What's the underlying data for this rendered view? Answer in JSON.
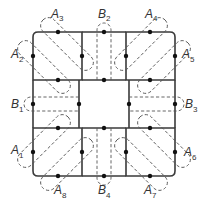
{
  "diagram": {
    "colors": {
      "line": "#3a3a3a",
      "dash": "#555555",
      "point": "#111111",
      "text": "#333333"
    },
    "labels": [
      {
        "id": "A1",
        "letter": "A",
        "index": "1"
      },
      {
        "id": "A2",
        "letter": "A",
        "index": "2"
      },
      {
        "id": "A3",
        "letter": "A",
        "index": "3"
      },
      {
        "id": "A4",
        "letter": "A",
        "index": "4"
      },
      {
        "id": "A5",
        "letter": "A",
        "index": "5"
      },
      {
        "id": "A6",
        "letter": "A",
        "index": "6"
      },
      {
        "id": "A7",
        "letter": "A",
        "index": "7"
      },
      {
        "id": "A8",
        "letter": "A",
        "index": "8"
      },
      {
        "id": "B1",
        "letter": "B",
        "index": "1"
      },
      {
        "id": "B2",
        "letter": "B",
        "index": "2"
      },
      {
        "id": "B3",
        "letter": "B",
        "index": "3"
      },
      {
        "id": "B4",
        "letter": "B",
        "index": "4"
      }
    ]
  }
}
